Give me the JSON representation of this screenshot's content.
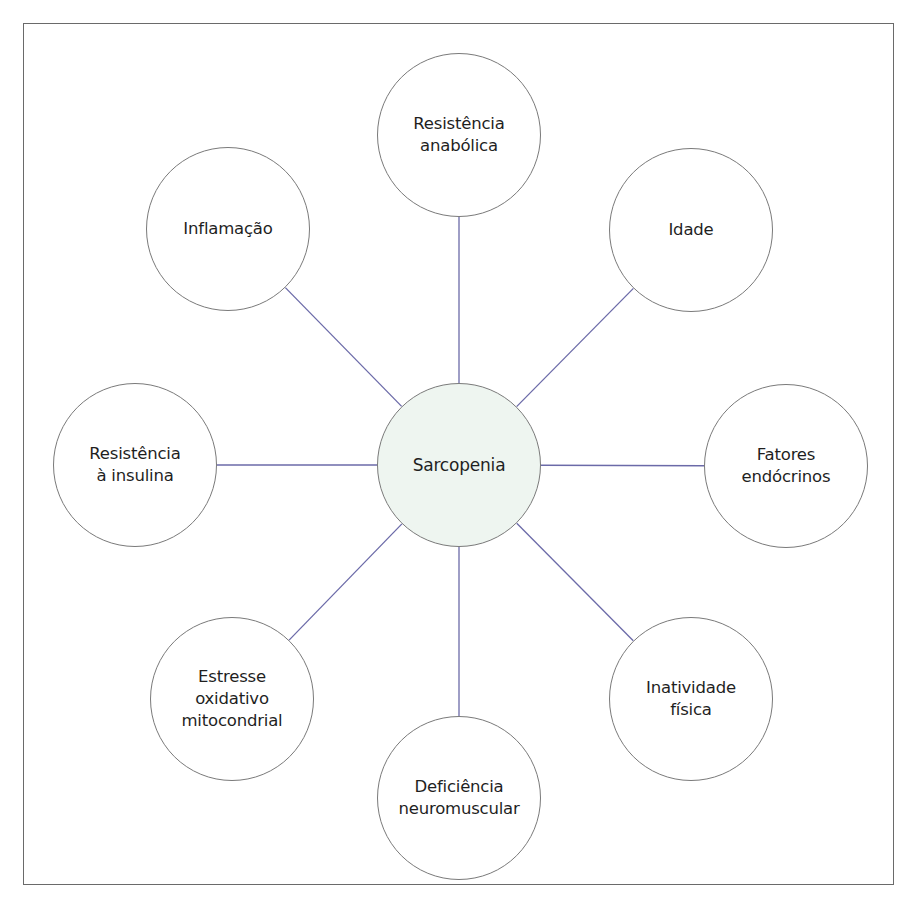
{
  "diagram": {
    "center": {
      "id": "sarcopenia",
      "label": "Sarcopenia",
      "cx": 459,
      "cy": 465,
      "r": 82,
      "fill": "#eef5f0"
    },
    "nodes": [
      {
        "id": "resistencia-anabolica",
        "label": "Resistência\nanabólica",
        "cx": 459,
        "cy": 135,
        "r": 82
      },
      {
        "id": "idade",
        "label": "Idade",
        "cx": 691,
        "cy": 230,
        "r": 82
      },
      {
        "id": "fatores-endocrinos",
        "label": "Fatores\nendócrinos",
        "cx": 786,
        "cy": 466,
        "r": 82
      },
      {
        "id": "inatividade-fisica",
        "label": "Inatividade\nfísica",
        "cx": 691,
        "cy": 699,
        "r": 82
      },
      {
        "id": "deficiencia-neuromuscular",
        "label": "Deficiência\nneuromuscular",
        "cx": 459,
        "cy": 798,
        "r": 82
      },
      {
        "id": "estresse-oxidativo",
        "label": "Estresse\noxidativo\nmitocondrial",
        "cx": 232,
        "cy": 699,
        "r": 82
      },
      {
        "id": "resistencia-insulina",
        "label": "Resistência\nà insulina",
        "cx": 135,
        "cy": 465,
        "r": 82
      },
      {
        "id": "inflamacao",
        "label": "Inflamação",
        "cx": 228,
        "cy": 229,
        "r": 82
      }
    ],
    "colors": {
      "connector": "#6b6aa8",
      "node_border": "#7a7a7a",
      "frame_border": "#6a6a6a",
      "text": "#1f1f1f"
    }
  }
}
